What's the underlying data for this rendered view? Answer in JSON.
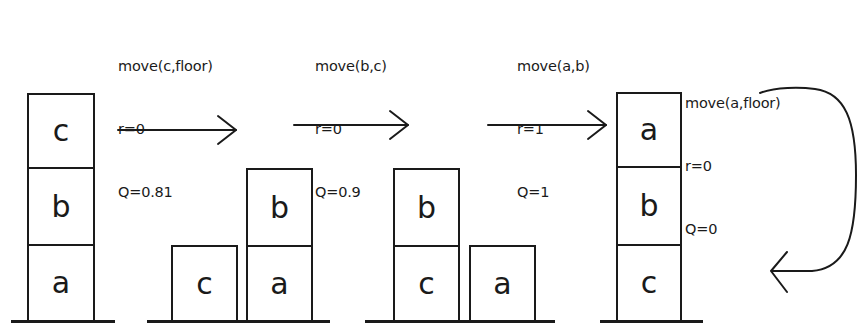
{
  "states": [
    {
      "id": "state-1",
      "blocks": [
        {
          "label": "c",
          "x": 27,
          "y": 93,
          "w": 68,
          "h": 76
        },
        {
          "label": "b",
          "x": 27,
          "y": 167,
          "w": 68,
          "h": 79
        },
        {
          "label": "a",
          "x": 27,
          "y": 244,
          "w": 68,
          "h": 78
        }
      ],
      "floor": {
        "x": 11,
        "y": 320,
        "w": 104
      }
    },
    {
      "id": "state-2",
      "blocks": [
        {
          "label": "c",
          "x": 171,
          "y": 245,
          "w": 67,
          "h": 77
        },
        {
          "label": "b",
          "x": 246,
          "y": 168,
          "w": 67,
          "h": 79
        },
        {
          "label": "a",
          "x": 246,
          "y": 245,
          "w": 67,
          "h": 77
        }
      ],
      "floor": {
        "x": 147,
        "y": 320,
        "w": 183
      }
    },
    {
      "id": "state-3",
      "blocks": [
        {
          "label": "b",
          "x": 393,
          "y": 168,
          "w": 67,
          "h": 79
        },
        {
          "label": "c",
          "x": 393,
          "y": 245,
          "w": 67,
          "h": 77
        },
        {
          "label": "a",
          "x": 469,
          "y": 245,
          "w": 67,
          "h": 77
        }
      ],
      "floor": {
        "x": 365,
        "y": 320,
        "w": 190
      }
    },
    {
      "id": "state-4",
      "blocks": [
        {
          "label": "a",
          "x": 616,
          "y": 92,
          "w": 66,
          "h": 76
        },
        {
          "label": "b",
          "x": 616,
          "y": 166,
          "w": 66,
          "h": 80
        },
        {
          "label": "c",
          "x": 616,
          "y": 244,
          "w": 66,
          "h": 78
        }
      ],
      "floor": {
        "x": 600,
        "y": 320,
        "w": 103
      }
    }
  ],
  "transitions": [
    {
      "action": "move(c,floor)",
      "reward": "r=0",
      "q_value": "Q=0.81",
      "label_x": 118,
      "label_y": 14
    },
    {
      "action": "move(b,c)",
      "reward": "r=0",
      "q_value": "Q=0.9",
      "label_x": 315,
      "label_y": 14
    },
    {
      "action": "move(a,b)",
      "reward": "r=1",
      "q_value": "Q=1",
      "label_x": 517,
      "label_y": 14
    },
    {
      "action": "move(a,floor)",
      "reward": "r=0",
      "q_value": "Q=0",
      "label_x": 685,
      "label_y": 51
    }
  ],
  "colors": {
    "ink": "#1a1a1a",
    "background": "#ffffff"
  }
}
